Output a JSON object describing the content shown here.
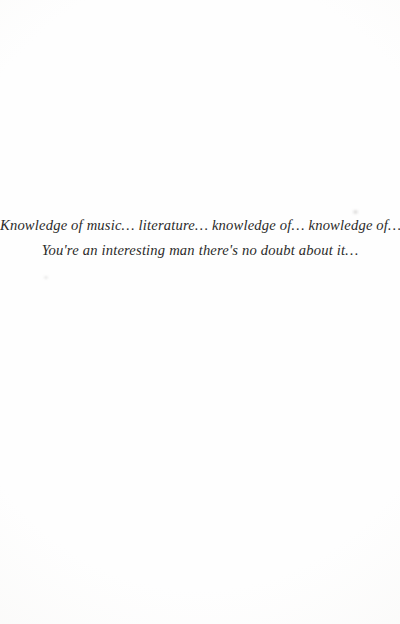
{
  "page": {
    "background_color": "#fefefe",
    "ink_color": "#2b2b2a",
    "kind": "scanned-book-page"
  },
  "quote": {
    "lines": [
      "Knowledge of music… literature… knowledge of… knowledge of…",
      "You're an interesting man there's no doubt about it…"
    ]
  }
}
